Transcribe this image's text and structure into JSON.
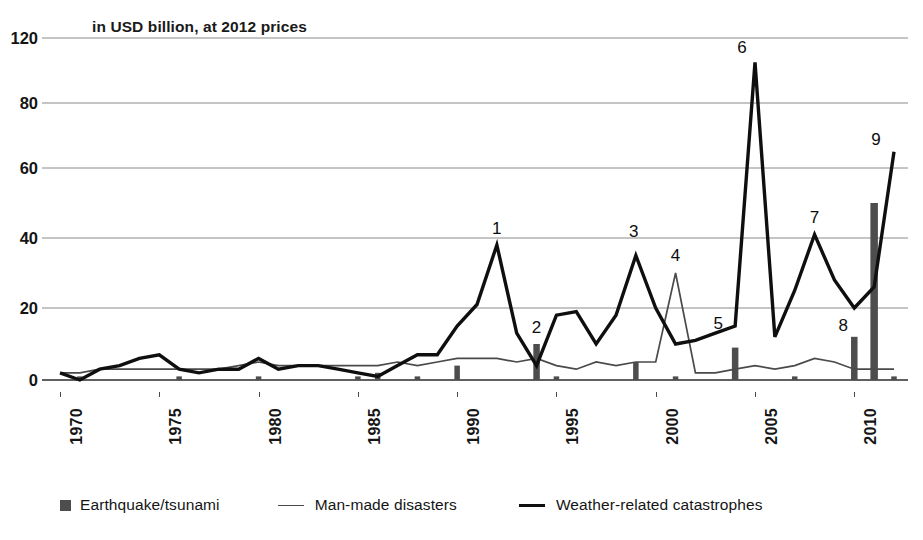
{
  "subtitle": "in USD billion, at 2012 prices",
  "legend": {
    "items": [
      {
        "label": "Earthquake/tsunami",
        "marker": "bar-swatch",
        "color": "#4d4d4d"
      },
      {
        "label": "Man-made disasters",
        "marker": "thin-line",
        "color": "#4a4a4a"
      },
      {
        "label": "Weather-related catastrophes",
        "marker": "thick-line",
        "color": "#0f0f0f"
      }
    ]
  },
  "chart_data": {
    "type": "line",
    "title": "",
    "subtitle": "in USD billion, at 2012 prices",
    "xlabel": "",
    "ylabel": "in USD billion, at 2012 prices",
    "xlim": [
      1970,
      2012
    ],
    "ylim": [
      0,
      120
    ],
    "yticks": [
      0,
      20,
      40,
      60,
      80,
      120
    ],
    "ytick_labels": [
      "0",
      "20",
      "40",
      "60",
      "80",
      "120"
    ],
    "xticks": [
      1970,
      1975,
      1980,
      1985,
      1990,
      1995,
      2000,
      2005,
      2010
    ],
    "xtick_labels": [
      "1970",
      "1975",
      "1980",
      "1985",
      "1990",
      "1995",
      "2000",
      "2005",
      "2010"
    ],
    "grid": "horizontal",
    "legend_position": "below",
    "x": [
      1970,
      1971,
      1972,
      1973,
      1974,
      1975,
      1976,
      1977,
      1978,
      1979,
      1980,
      1981,
      1982,
      1983,
      1984,
      1985,
      1986,
      1987,
      1988,
      1989,
      1990,
      1991,
      1992,
      1993,
      1994,
      1995,
      1996,
      1997,
      1998,
      1999,
      2000,
      2001,
      2002,
      2003,
      2004,
      2005,
      2006,
      2007,
      2008,
      2009,
      2010,
      2011,
      2012
    ],
    "series": [
      {
        "name": "Weather-related catastrophes",
        "type": "line",
        "style": "thick",
        "color": "#0f0f0f",
        "values": [
          2,
          0,
          3,
          4,
          6,
          7,
          3,
          2,
          3,
          3,
          6,
          3,
          4,
          4,
          3,
          2,
          1,
          4,
          7,
          7,
          15,
          21,
          38,
          13,
          4,
          18,
          19,
          10,
          18,
          35,
          20,
          10,
          11,
          13,
          15,
          105,
          12,
          25,
          41,
          28,
          20,
          26,
          65
        ]
      },
      {
        "name": "Man-made disasters",
        "type": "line",
        "style": "thin",
        "color": "#4a4a4a",
        "values": [
          2,
          2,
          3,
          3,
          3,
          3,
          3,
          3,
          3,
          4,
          5,
          4,
          4,
          4,
          4,
          4,
          4,
          5,
          4,
          5,
          6,
          6,
          6,
          5,
          6,
          4,
          3,
          5,
          4,
          5,
          5,
          30,
          2,
          2,
          3,
          4,
          3,
          4,
          6,
          5,
          3,
          3,
          3
        ]
      },
      {
        "name": "Earthquake/tsunami",
        "type": "bar",
        "color": "#4d4d4d",
        "values": [
          0,
          1,
          0,
          0,
          0,
          0,
          1,
          0,
          0,
          0,
          1,
          0,
          0,
          0,
          0,
          1,
          2,
          0,
          1,
          0,
          4,
          0,
          0,
          0,
          10,
          1,
          0,
          0,
          0,
          5,
          0,
          1,
          0,
          0,
          9,
          0,
          0,
          1,
          0,
          0,
          12,
          50,
          1
        ]
      }
    ],
    "annotations": [
      {
        "label": "1",
        "x": 1992,
        "y": 38,
        "series": "Weather-related catastrophes"
      },
      {
        "label": "2",
        "x": 1994,
        "y": 10,
        "series": "Earthquake/tsunami"
      },
      {
        "label": "3",
        "x": 1999,
        "y": 35,
        "series": "Weather-related catastrophes"
      },
      {
        "label": "4",
        "x": 2001,
        "y": 30,
        "series": "Man-made disasters"
      },
      {
        "label": "5",
        "x": 2004,
        "y": 15,
        "series": "Weather-related catastrophes"
      },
      {
        "label": "6",
        "x": 2005,
        "y": 105,
        "series": "Weather-related catastrophes"
      },
      {
        "label": "7",
        "x": 2008,
        "y": 41,
        "series": "Weather-related catastrophes"
      },
      {
        "label": "8",
        "x": 2010,
        "y": 12,
        "series": "Earthquake/tsunami"
      },
      {
        "label": "9",
        "x": 2012,
        "y": 65,
        "series": "Weather-related catastrophes"
      }
    ]
  }
}
